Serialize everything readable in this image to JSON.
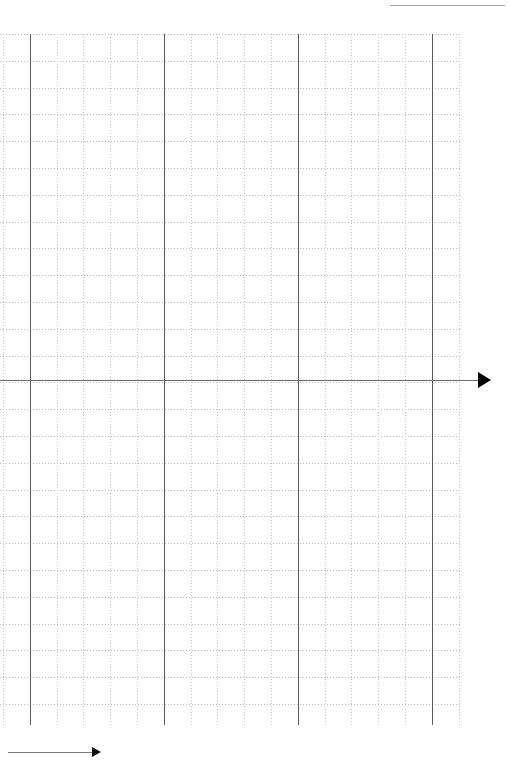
{
  "page": {
    "background_color": "#ffffff",
    "width": 510,
    "height": 769
  },
  "chart_data": {
    "type": "scatter",
    "title": "",
    "subtitle": "",
    "xlabel": "",
    "ylabel": "",
    "series": [],
    "x": [],
    "values": [],
    "categories": [],
    "annotations": [],
    "legend": {
      "visible": false,
      "position": "none",
      "entries": []
    },
    "grid": {
      "visible": true,
      "style": "dotted",
      "minor_spacing_px": 26.8,
      "minor_color": "#c0c0c8",
      "major_color": "#5a5a66",
      "major_every_n_minor": 5
    },
    "axes": {
      "x_axis": {
        "visible": true,
        "y_px": 380,
        "color": "#6a6a72",
        "arrow": "right",
        "tick_labels": [],
        "range_px": [
          0,
          478
        ]
      },
      "y_axis": {
        "visible": true,
        "x_px": 30,
        "color": "#5a5a66",
        "arrow": "none",
        "tick_labels": [],
        "range_px": [
          34,
          725
        ]
      }
    },
    "plot_area_px": {
      "left": 0,
      "top": 34,
      "right": 462,
      "bottom": 725
    },
    "major_vertical_lines_px": [
      30,
      164,
      298,
      432
    ],
    "major_horizontal_lines_px": [
      380
    ],
    "data_points": []
  },
  "elements": {
    "top_right_rule": {
      "name": "horizontal rule",
      "x": 390,
      "y": 5,
      "width": 115,
      "color": "#a8a8b0"
    },
    "x_axis": {
      "name": "x axis with arrowhead",
      "y": 380,
      "x_start": 0,
      "x_end": 478,
      "arrow_direction": "right"
    },
    "bottom_ruler": {
      "name": "measurement arrow",
      "y": 752,
      "x_start": 8,
      "x_end": 92,
      "arrow_direction": "right"
    }
  },
  "labels": {
    "none_visible": ""
  }
}
